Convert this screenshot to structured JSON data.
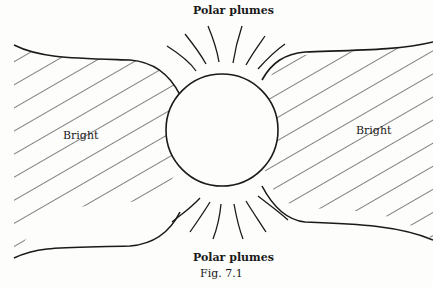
{
  "figure": {
    "caption": "Fig. 7.1",
    "labels": {
      "top": "Polar plumes",
      "bottom": "Polar plumes",
      "left": "Bright",
      "right": "Bright"
    },
    "colors": {
      "ink": "#1a1a1a",
      "paper": "#fdfdfb"
    },
    "sun": {
      "cx": 222,
      "cy": 130,
      "r": 56
    }
  }
}
